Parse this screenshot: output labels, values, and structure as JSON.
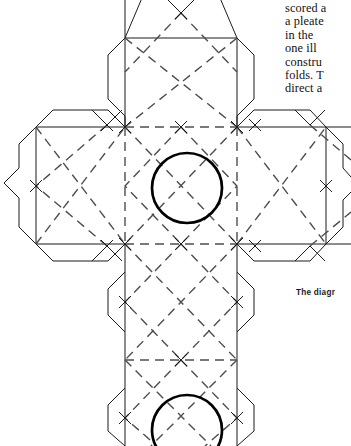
{
  "page": {
    "width": 351,
    "height": 446,
    "background": "#ffffff",
    "ink_color": "#1b1b1b"
  },
  "body_text": {
    "lines": [
      "scored a",
      "a pleate",
      "in the",
      "one ill",
      "constru",
      "folds. T",
      "direct a"
    ]
  },
  "caption": {
    "text": "The diagr"
  },
  "figure": {
    "solid_line_color": "#1b1b1b",
    "dashed_line_color": "#555555",
    "circle_color": "#000000",
    "solid_stroke_width": 1,
    "dashed_stroke_width": 1.4,
    "circle_stroke_width": 2.6,
    "dash_pattern": "9 6",
    "grid": {
      "col_left": 8,
      "col_mid_left": 125,
      "col_mid_right": 237,
      "col_right": 351,
      "row_top": 10,
      "row_upper": 127,
      "row_lower": 244,
      "row_bottom": 360,
      "row_end": 446,
      "tab_depth": 26,
      "corner_cut": 17
    },
    "circles": [
      {
        "cx": 187,
        "cy": 188,
        "r": 35,
        "name": "upper-circle"
      },
      {
        "cx": 187,
        "cy": 430,
        "r": 35,
        "name": "lower-circle"
      }
    ],
    "panels": [
      {
        "name": "panel-top",
        "x": 125,
        "y": 10,
        "w": 112,
        "h": 117
      },
      {
        "name": "panel-left",
        "x": 8,
        "y": 127,
        "w": 117,
        "h": 117
      },
      {
        "name": "panel-center",
        "x": 125,
        "y": 127,
        "w": 112,
        "h": 117
      },
      {
        "name": "panel-right",
        "x": 237,
        "y": 127,
        "w": 114,
        "h": 117
      },
      {
        "name": "panel-lower",
        "x": 125,
        "y": 244,
        "w": 112,
        "h": 116
      },
      {
        "name": "panel-bottom",
        "x": 125,
        "y": 360,
        "w": 112,
        "h": 86
      }
    ]
  }
}
